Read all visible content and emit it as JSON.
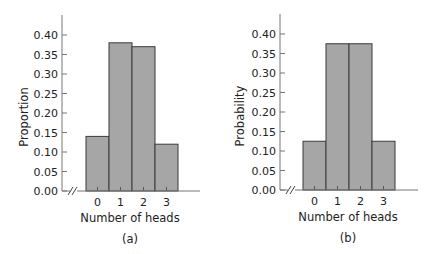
{
  "chart_data": [
    {
      "type": "bar",
      "panel_label": "(a)",
      "title": "",
      "xlabel": "Number of heads",
      "ylabel": "Proportion",
      "categories": [
        "0",
        "1",
        "2",
        "3"
      ],
      "values": [
        0.14,
        0.38,
        0.37,
        0.12
      ],
      "ylim": [
        0,
        0.4
      ],
      "yticks": [
        "0.00",
        "0.05",
        "0.10",
        "0.15",
        "0.20",
        "0.25",
        "0.30",
        "0.35",
        "0.40"
      ],
      "axis_break": true,
      "grid": false,
      "bar_color": "#a6a6a6",
      "bar_edge_color": "#3a3a3a"
    },
    {
      "type": "bar",
      "panel_label": "(b)",
      "title": "",
      "xlabel": "Number of heads",
      "ylabel": "Probability",
      "categories": [
        "0",
        "1",
        "2",
        "3"
      ],
      "values": [
        0.125,
        0.375,
        0.375,
        0.125
      ],
      "ylim": [
        0,
        0.4
      ],
      "yticks": [
        "0.00",
        "0.05",
        "0.10",
        "0.15",
        "0.20",
        "0.25",
        "0.30",
        "0.35",
        "0.40"
      ],
      "axis_break": true,
      "grid": false,
      "bar_color": "#a6a6a6",
      "bar_edge_color": "#3a3a3a"
    }
  ]
}
